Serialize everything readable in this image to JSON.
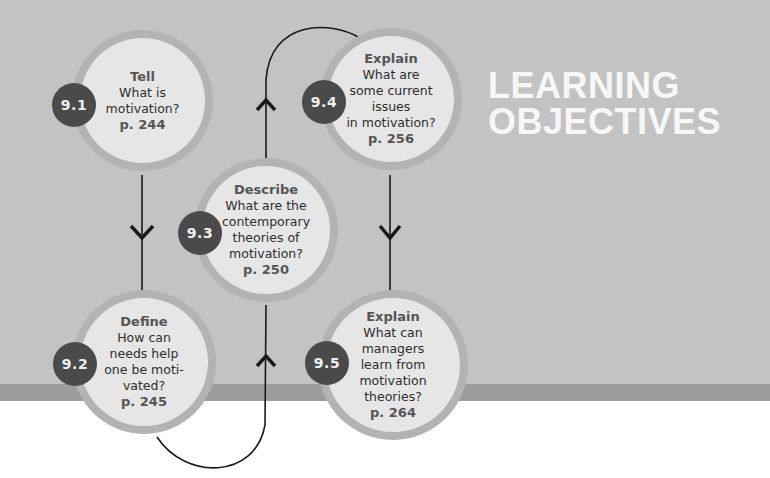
{
  "title": {
    "line1": "LEARNING",
    "line2": "OBJECTIVES"
  },
  "colors": {
    "background": "#c3c3c3",
    "band": "#9c9c9c",
    "node_fill": "#e6e6e6",
    "node_ring": "#b3b3b3",
    "badge": "#4a4a4a",
    "title_text": "#f7f7f7"
  },
  "objectives": [
    {
      "number": "9.1",
      "verb": "Tell",
      "question": "What is\nmotivation?",
      "page": "p. 244"
    },
    {
      "number": "9.2",
      "verb": "Define",
      "question": "How can\nneeds help\none be moti-\nvated?",
      "page": "p. 245"
    },
    {
      "number": "9.3",
      "verb": "Describe",
      "question": "What are the\ncontemporary\ntheories of\nmotivation?",
      "page": "p. 250"
    },
    {
      "number": "9.4",
      "verb": "Explain",
      "question": "What are\nsome current\nissues\nin motivation?",
      "page": "p. 256"
    },
    {
      "number": "9.5",
      "verb": "Explain",
      "question": "What can\nmanagers\nlearn from\nmotivation\ntheories?",
      "page": "p. 264"
    }
  ],
  "flow": [
    "9.1",
    "9.2",
    "9.3",
    "9.4",
    "9.5"
  ]
}
